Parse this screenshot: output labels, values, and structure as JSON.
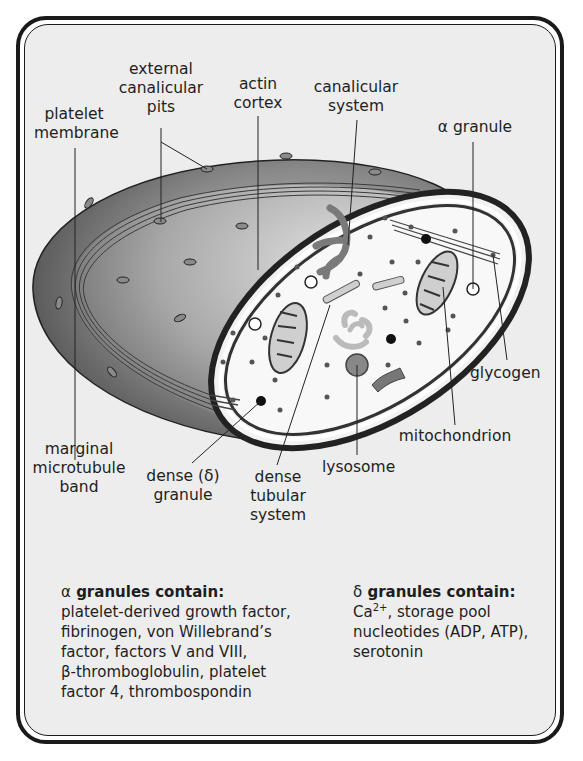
{
  "figure": {
    "labels": {
      "platelet_membrane": [
        "platelet",
        "membrane"
      ],
      "external_canalicular_pits": [
        "external",
        "canalicular",
        "pits"
      ],
      "actin_cortex": [
        "actin",
        "cortex"
      ],
      "canalicular_system": [
        "canalicular",
        "system"
      ],
      "alpha_granule": "α granule",
      "glycogen": "glycogen",
      "mitochondrion": "mitochondrion",
      "lysosome": "lysosome",
      "dense_tubular_system": [
        "dense",
        "tubular",
        "system"
      ],
      "dense_granule": [
        "dense (δ)",
        "granule"
      ],
      "marginal_microtubule_band": [
        "marginal",
        "microtubule",
        "band"
      ]
    },
    "colors": {
      "page_background": "#ffffff",
      "panel_background": "#ededed",
      "frame": "#1a1a1a",
      "platelet_shell_dark": "#555555",
      "platelet_shell_light": "#bdbdbd",
      "cytoplasm": "#f7f7f7",
      "organelle_fill": "#cfcfcf",
      "organelle_dark": "#7a7a7a",
      "granule_dark": "#111111"
    }
  },
  "legend": {
    "alpha": {
      "greek": "α",
      "title": "granules contain:",
      "lines": [
        "platelet-derived growth factor,",
        "fibrinogen, von Willebrand’s",
        "factor, factors V and VIII,",
        "β-thromboglobulin, platelet",
        "factor 4, thrombospondin"
      ]
    },
    "delta": {
      "greek": "δ",
      "title": "granules contain:",
      "line1_prefix": "Ca",
      "line1_sup": "2+",
      "line1_suffix": ", storage pool",
      "lines": [
        "nucleotides (ADP, ATP),",
        "serotonin"
      ]
    }
  }
}
